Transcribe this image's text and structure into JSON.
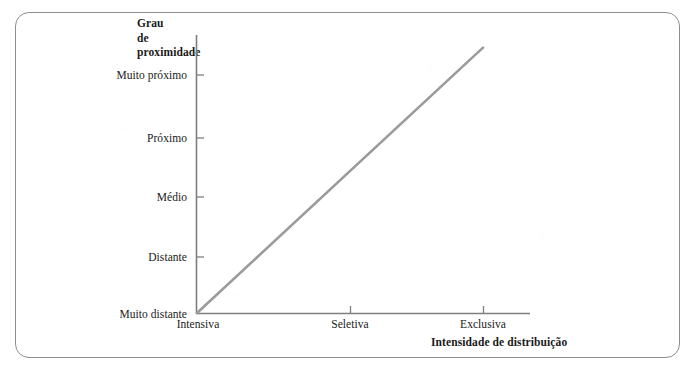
{
  "figure": {
    "frame_color": "#8e8e8e",
    "background": "#ffffff"
  },
  "chart_data": {
    "type": "line",
    "title": "",
    "subtitle": "",
    "xlabel": "Intensidade de distribuição",
    "ylabel": "Grau de proximidade",
    "ylabel_lines": [
      "Grau",
      "de",
      "proximidade"
    ],
    "categories": [
      "Intensiva",
      "Seletiva",
      "Exclusiva"
    ],
    "x": [
      0,
      1,
      2
    ],
    "yticklabels": [
      "Muito distante",
      "Distante",
      "Médio",
      "Próximo",
      "Muito próximo"
    ],
    "ylim": [
      0,
      4
    ],
    "xlim": [
      0,
      2.35
    ],
    "grid": false,
    "legend": null,
    "series": [
      {
        "name": "Grau de proximidade vs Intensidade de distribuição",
        "color": "#9b9b9b",
        "x": [
          0,
          2
        ],
        "values": [
          0,
          4.35
        ],
        "points": [
          {
            "x_label": "Intensiva",
            "y_label": "Muito distante"
          },
          {
            "x_label": "Exclusiva",
            "y_label": "acima de Muito próximo"
          }
        ]
      }
    ],
    "annotations": []
  },
  "axes": {
    "y_title_lines": [
      "Grau",
      "de",
      "proximidade"
    ],
    "x_title": "Intensidade de distribuição",
    "y_ticks": [
      {
        "label": "Muito próximo",
        "y": 69
      },
      {
        "label": "Próximo",
        "y": 132
      },
      {
        "label": "Médio",
        "y": 191
      },
      {
        "label": "Distante",
        "y": 251
      },
      {
        "label": "Muito distante",
        "y": 308
      }
    ],
    "x_ticks": [
      {
        "label": "Intensiva",
        "x": 198
      },
      {
        "label": "Seletiva",
        "x": 350
      },
      {
        "label": "Exclusiva",
        "x": 483
      }
    ],
    "axis_color": "#7f7f7f",
    "line_color": "#9b9b9b"
  }
}
